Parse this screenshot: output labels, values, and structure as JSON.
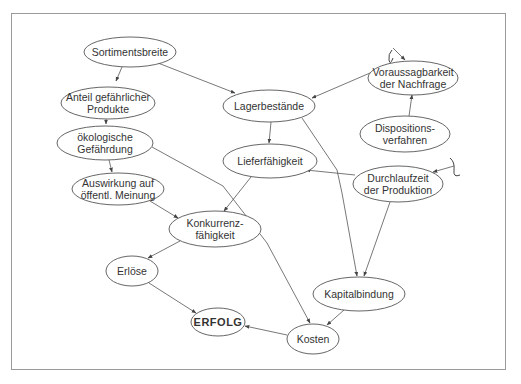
{
  "diagram": {
    "type": "cause-effect network",
    "nodes": [
      {
        "id": "sortimentsbreite",
        "lines": [
          "Sortimentsbreite"
        ],
        "cx": 130,
        "cy": 52,
        "rx": 46,
        "ry": 15
      },
      {
        "id": "anteil",
        "lines": [
          "Anteil gefährlicher",
          "Produkte"
        ],
        "cx": 108,
        "cy": 103,
        "rx": 47,
        "ry": 16
      },
      {
        "id": "oekologisch",
        "lines": [
          "ökologische",
          "Gefährdung"
        ],
        "cx": 105,
        "cy": 143,
        "rx": 48,
        "ry": 17
      },
      {
        "id": "auswirkung",
        "lines": [
          "Auswirkung auf",
          "öffentl. Meinung"
        ],
        "cx": 118,
        "cy": 189,
        "rx": 46,
        "ry": 16
      },
      {
        "id": "lager",
        "lines": [
          "Lagerbestände"
        ],
        "cx": 269,
        "cy": 106,
        "rx": 46,
        "ry": 16
      },
      {
        "id": "liefer",
        "lines": [
          "Lieferfähigkeit"
        ],
        "cx": 270,
        "cy": 161,
        "rx": 47,
        "ry": 17
      },
      {
        "id": "konkurrenz",
        "lines": [
          "Konkurrenz-",
          "fähigkeit"
        ],
        "cx": 215,
        "cy": 229,
        "rx": 46,
        "ry": 18
      },
      {
        "id": "erloese",
        "lines": [
          "Erlöse"
        ],
        "cx": 132,
        "cy": 271,
        "rx": 26,
        "ry": 15
      },
      {
        "id": "erfolg",
        "lines": [
          "ERFOLG"
        ],
        "cx": 218,
        "cy": 322,
        "rx": 27,
        "ry": 14,
        "bold": true
      },
      {
        "id": "voraussag",
        "lines": [
          "Voraussagbarkeit",
          "der Nachfrage"
        ],
        "cx": 413,
        "cy": 78,
        "rx": 45,
        "ry": 17
      },
      {
        "id": "disposition",
        "lines": [
          "Dispositions-",
          "verfahren"
        ],
        "cx": 405,
        "cy": 134,
        "rx": 45,
        "ry": 18
      },
      {
        "id": "durchlauf",
        "lines": [
          "Durchlaufzeit",
          "der Produktion"
        ],
        "cx": 398,
        "cy": 184,
        "rx": 45,
        "ry": 18
      },
      {
        "id": "kapital",
        "lines": [
          "Kapitalbindung"
        ],
        "cx": 359,
        "cy": 294,
        "rx": 46,
        "ry": 17
      },
      {
        "id": "kosten",
        "lines": [
          "Kosten"
        ],
        "cx": 313,
        "cy": 339,
        "rx": 26,
        "ry": 15
      }
    ],
    "edges": [
      {
        "from": "sortimentsbreite",
        "to": "anteil",
        "points": [
          [
            122,
            67
          ],
          [
            116,
            81
          ]
        ]
      },
      {
        "from": "sortimentsbreite",
        "to": "lager",
        "points": [
          [
            158,
            63
          ],
          [
            235,
            93
          ]
        ]
      },
      {
        "from": "anteil",
        "to": "oekologisch",
        "points": [
          [
            106,
            119
          ],
          [
            106,
            124
          ]
        ]
      },
      {
        "from": "oekologisch",
        "to": "auswirkung",
        "points": [
          [
            109,
            160
          ],
          [
            112,
            172
          ]
        ]
      },
      {
        "from": "oekologisch",
        "to": "kosten",
        "points": [
          [
            152,
            147
          ],
          [
            223,
            186
          ],
          [
            267,
            243
          ],
          [
            310,
            323
          ]
        ]
      },
      {
        "from": "voraussag",
        "to": "lager",
        "points": [
          [
            370,
            73
          ],
          [
            312,
            98
          ]
        ]
      },
      {
        "from": "disposition",
        "to": "voraussag",
        "points": [
          [
            409,
            116
          ],
          [
            412,
            95
          ]
        ]
      },
      {
        "from": "lager",
        "to": "liefer",
        "points": [
          [
            271,
            122
          ],
          [
            269,
            143
          ]
        ]
      },
      {
        "from": "lager",
        "to": "kapital",
        "points": [
          [
            302,
            118
          ],
          [
            337,
            170
          ],
          [
            342,
            193
          ],
          [
            357,
            276
          ]
        ]
      },
      {
        "from": "durchlauf",
        "to": "liefer",
        "points": [
          [
            355,
            175
          ],
          [
            306,
            170
          ]
        ]
      },
      {
        "from": "durchlauf",
        "to": "kapital",
        "points": [
          [
            390,
            202
          ],
          [
            364,
            276
          ]
        ]
      },
      {
        "from": "liefer",
        "to": "konkurrenz",
        "points": [
          [
            251,
            177
          ],
          [
            224,
            211
          ]
        ]
      },
      {
        "from": "auswirkung",
        "to": "konkurrenz",
        "points": [
          [
            150,
            201
          ],
          [
            178,
            218
          ]
        ]
      },
      {
        "from": "konkurrenz",
        "to": "erloese",
        "points": [
          [
            180,
            241
          ],
          [
            148,
            258
          ]
        ]
      },
      {
        "from": "erloese",
        "to": "erfolg",
        "points": [
          [
            149,
            283
          ],
          [
            196,
            313
          ]
        ]
      },
      {
        "from": "kapital",
        "to": "kosten",
        "points": [
          [
            344,
            310
          ],
          [
            327,
            325
          ]
        ]
      },
      {
        "from": "kosten",
        "to": "erfolg",
        "points": [
          [
            287,
            335
          ],
          [
            245,
            326
          ]
        ]
      }
    ],
    "external_inputs": [
      {
        "to": "voraussag",
        "squiggle": [
          [
            392,
            50
          ],
          [
            388,
            54
          ],
          [
            389,
            60
          ],
          [
            393,
            58
          ]
        ],
        "arrow": [
          [
            393,
            48
          ],
          [
            405,
            60
          ]
        ]
      },
      {
        "to": "durchlauf",
        "squiggle": [
          [
            450,
            158
          ],
          [
            455,
            162
          ],
          [
            454,
            170
          ],
          [
            460,
            175
          ]
        ],
        "arrow": [
          [
            454,
            166
          ],
          [
            433,
            172
          ]
        ]
      }
    ]
  }
}
